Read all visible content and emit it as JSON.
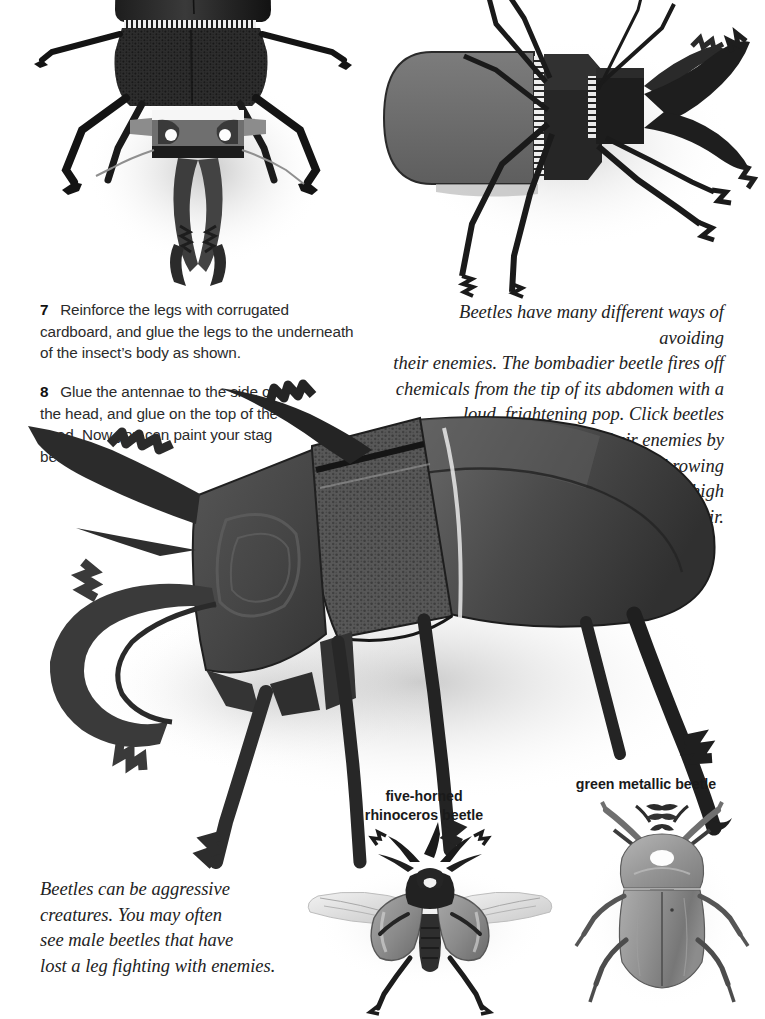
{
  "page": {
    "background": "#ffffff",
    "width": 765,
    "height": 1019
  },
  "steps": [
    {
      "number": "7",
      "text": "Reinforce the legs with corrugated cardboard, and glue the legs to the underneath of the insect’s body as shown."
    },
    {
      "number": "8",
      "text": "Glue the antennae to the side of the head, and glue on the top of the head. Now you can paint your stag beetle."
    }
  ],
  "sidebars": [
    {
      "id": "avoiding-enemies",
      "align": "right",
      "text": "Beetles have many different ways of avoiding their enemies. The bombadier beetle fires off chemicals from the tip of its abdomen with a loud, frightening pop. Click beetles escape their enemies by suddenly throwing themselves high in the air.",
      "lines": [
        "Beetles have many different ways of avoiding",
        "their enemies. The bombadier beetle fires off",
        "chemicals from the tip of its abdomen with a",
        "loud, frightening pop. Click beetles",
        "escape their enemies by",
        "suddenly throwing",
        "themselves high",
        "in the air."
      ]
    },
    {
      "id": "aggressive-creatures",
      "align": "left",
      "text": "Beetles can be aggressive creatures. You may often see male beetles that have lost a leg fighting with enemies.",
      "lines": [
        "Beetles can be aggressive",
        "creatures. You may often",
        "see male beetles that have",
        "lost a leg fighting with enemies."
      ]
    }
  ],
  "captions": [
    {
      "id": "rhinoceros",
      "line1": "five-horned",
      "line2": "rhinoceros beetle"
    },
    {
      "id": "green-metallic",
      "line1": "green metallic beetle",
      "line2": ""
    }
  ],
  "photos": [
    {
      "id": "model-underside",
      "label": "cardboard stag beetle model — underside view"
    },
    {
      "id": "model-top",
      "label": "cardboard stag beetle model — top view"
    },
    {
      "id": "model-finished",
      "label": "finished cardboard stag beetle model — side view"
    },
    {
      "id": "rhinoceros-beetle-photo",
      "label": "five-horned rhinoceros beetle photograph"
    },
    {
      "id": "green-metallic-beetle-photo",
      "label": "green metallic beetle photograph"
    }
  ],
  "colors": {
    "paper_dark": "#2d2d2d",
    "paper_mid": "#6e6e6e",
    "paper_light": "#8e8e8e",
    "black": "#141414",
    "shadow": "#bdbdbd",
    "background": "#ffffff",
    "text": "#2b2b2b"
  }
}
